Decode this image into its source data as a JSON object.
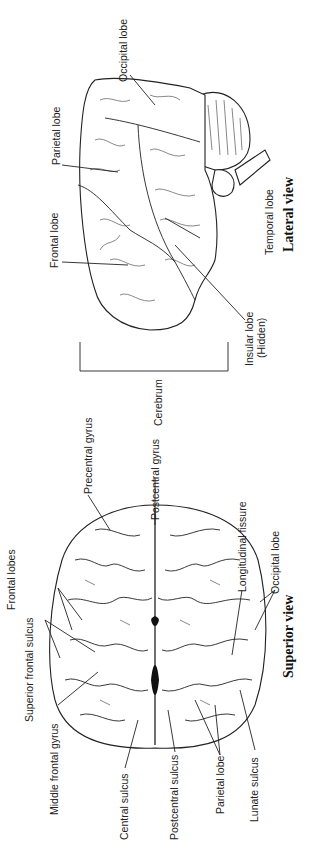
{
  "orientation": "rotated 90 degrees counter-clockwise",
  "lateral_view": {
    "title": "Lateral view",
    "labels": {
      "occipital_lobe": "Occipital lobe",
      "parietal_lobe": "Parietal lobe",
      "frontal_lobe": "Frontal lobe",
      "temporal_lobe": "Temporal lobe",
      "insular_lobe": "Insular lobe",
      "insular_note": "(Hidden)"
    }
  },
  "bracket": {
    "label": "Cerebrum"
  },
  "superior_view": {
    "title": "Superior view",
    "labels": {
      "frontal_lobes": "Frontal lobes",
      "superior_frontal_sulcus": "Superior frontal sulcus",
      "middle_frontal_gyrus": "Middle frontal gyrus",
      "central_sulcus": "Central sulcus",
      "precentral_gyrus": "Precentral gyrus",
      "postcentral_gyrus": "Postcentral gyrus",
      "postcentral_sulcus": "Postcentral sulcus",
      "parietal_lobe": "Parietal lobe",
      "lunate_sulcus": "Lunate sulcus",
      "longitudinal_fissure": "Longitudinal fissure",
      "occipital_lobe": "Occipital lobe"
    }
  }
}
